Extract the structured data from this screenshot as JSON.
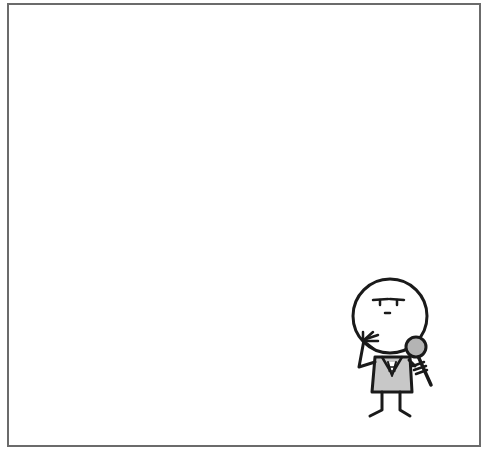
{
  "panel": {
    "border_color": "#6b6b6b",
    "background": "#ffffff"
  },
  "figure": {
    "head_icon": "thinking-face-icon",
    "microphone_icon": "microphone-icon",
    "vest_color": "#c8c8c8",
    "mic_color": "#b4b4b4",
    "stroke_color": "#1a1a1a"
  }
}
